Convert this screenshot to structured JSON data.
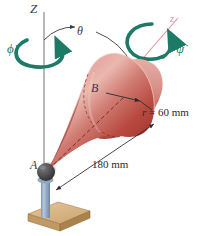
{
  "figure": {
    "labels": {
      "vertical_axis": "Z",
      "cone_axis": "z",
      "nutation_angle": "θ",
      "precession_rate": "ϕ̇",
      "spin_rate": "ψ̇",
      "apex_point": "A",
      "base_center_point": "B",
      "radius_dim": "r = 60 mm",
      "radius_symbol": "r",
      "radius_equals": " = 60 mm",
      "slant_dim": "180 mm"
    },
    "dimensions": {
      "radius_value": 60,
      "radius_unit": "mm",
      "slant_value": 180,
      "slant_unit": "mm"
    },
    "colors": {
      "cone_light": "#e5a8a0",
      "cone_mid": "#cc6f68",
      "cone_dark": "#a33a32",
      "cone_deep": "#8e2a22",
      "arrow_green": "#1d7a66",
      "axis_red": "#e3909a",
      "axis_gray": "#8c8c8c",
      "base_wood": "#d9b68c",
      "base_wood_dark": "#bb935f",
      "post_blue": "#9fb6cf",
      "sphere_dark": "#4a4a4a",
      "text": "#2b2b2b"
    }
  }
}
